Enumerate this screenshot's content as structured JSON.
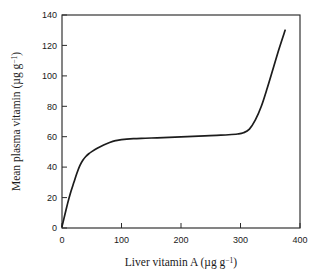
{
  "chart_data": {
    "type": "line",
    "title": "",
    "xlabel": "Liver vitamin A (µg g⁻¹)",
    "ylabel": "Mean plasma vitamin (µg g⁻¹)",
    "xlim": [
      0,
      400
    ],
    "ylim": [
      0,
      140
    ],
    "xticks": [
      0,
      100,
      200,
      300,
      400
    ],
    "yticks": [
      0,
      20,
      40,
      60,
      80,
      100,
      120,
      140
    ],
    "xtick_labels": [
      "0",
      "100",
      "200",
      "300",
      "400"
    ],
    "ytick_labels": [
      "0",
      "20",
      "40",
      "60",
      "80",
      "100",
      "120",
      "140"
    ],
    "grid": false,
    "legend": false,
    "series": [
      {
        "name": "plasma vitamin A response",
        "color": "#1c1c1c",
        "x": [
          0,
          5,
          10,
          15,
          20,
          25,
          30,
          35,
          40,
          45,
          50,
          60,
          70,
          80,
          90,
          100,
          120,
          140,
          160,
          180,
          200,
          220,
          240,
          260,
          280,
          295,
          305,
          315,
          325,
          335,
          345,
          355,
          365,
          375
        ],
        "y": [
          1,
          9,
          17,
          24,
          30,
          36,
          41,
          44.5,
          47,
          48.8,
          50.2,
          52.6,
          54.6,
          56.2,
          57.4,
          58.1,
          58.7,
          59.0,
          59.3,
          59.6,
          59.9,
          60.2,
          60.5,
          60.9,
          61.3,
          61.8,
          62.6,
          65,
          71,
          80,
          92,
          105,
          118,
          130
        ]
      }
    ],
    "notes": {
      "plateau_value": 60,
      "upturn_start_x": 305,
      "endpoint": [
        375,
        130
      ]
    }
  },
  "axes": {
    "xlabel": "Liver vitamin A (µg g⁻¹)",
    "ylabel": "Mean plasma vitamin (µg g⁻¹)",
    "xlabel_main": "Liver vitamin A (µg g",
    "xlabel_sup": "−1",
    "xlabel_tail": ")",
    "ylabel_main": "Mean plasma vitamin (µg g",
    "ylabel_sup": "−1",
    "ylabel_tail": ")"
  },
  "colors": {
    "curve": "#1c1c1c",
    "frame": "#2b2b2b",
    "background": "#ffffff",
    "text": "#1a1a1a"
  }
}
